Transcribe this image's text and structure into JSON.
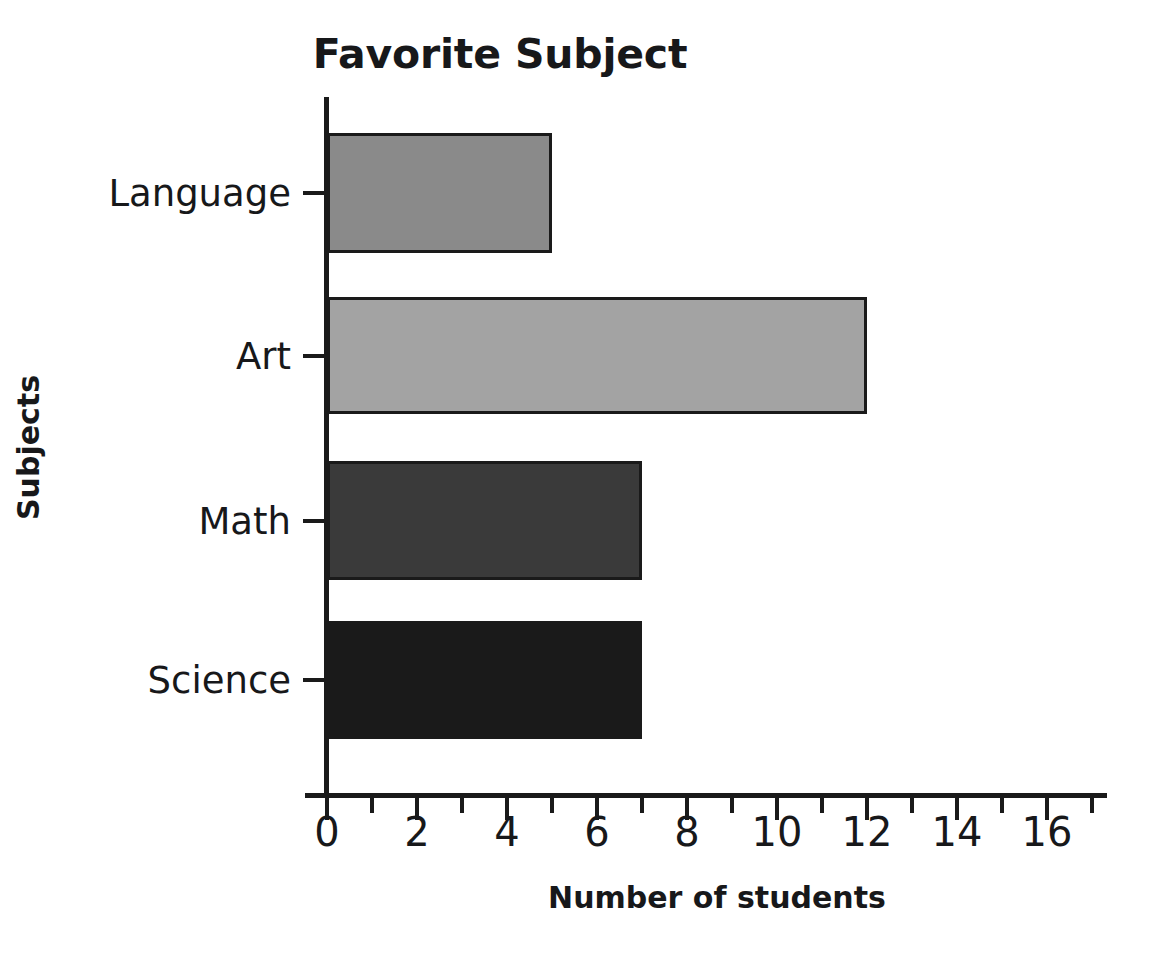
{
  "chart_data": {
    "type": "bar",
    "orientation": "horizontal",
    "title": "Favorite Subject",
    "xlabel": "Number of students",
    "ylabel": "Subjects",
    "categories": [
      "Language",
      "Art",
      "Math",
      "Science"
    ],
    "values": [
      5,
      12,
      7,
      7
    ],
    "xlim": [
      0,
      18
    ],
    "ylim": [
      0,
      4
    ],
    "grid": false,
    "legend": false,
    "x_major_ticks": [
      0,
      2,
      4,
      6,
      8,
      10,
      12,
      14,
      16
    ],
    "x_minor_ticks": [
      1,
      3,
      5,
      7,
      9,
      11,
      13,
      15,
      17
    ],
    "x_tick_labels": [
      "0",
      "2",
      "4",
      "6",
      "8",
      "10",
      "12",
      "14",
      "16"
    ],
    "bar_colors": [
      "#8a8a8a",
      "#a3a3a3",
      "#3a3a3a",
      "#1a1a1a"
    ],
    "bar_edge_color": "#1a1a1a",
    "axis_color": "#1a1a1a",
    "background_color": "#ffffff",
    "series": [
      {
        "name": "Number of students",
        "points": [
          {
            "category": "Language",
            "value": 5,
            "color": "#8a8a8a"
          },
          {
            "category": "Art",
            "value": 12,
            "color": "#a3a3a3"
          },
          {
            "category": "Math",
            "value": 7,
            "color": "#3a3a3a"
          },
          {
            "category": "Science",
            "value": 7,
            "color": "#1a1a1a"
          }
        ]
      }
    ]
  },
  "geometry": {
    "origin_x": 327,
    "px_per_unit": 45,
    "baseline_y": 793,
    "rows": [
      {
        "top": 133,
        "height": 120
      },
      {
        "top": 297,
        "height": 117
      },
      {
        "top": 461,
        "height": 119
      },
      {
        "top": 621,
        "height": 118
      }
    ]
  }
}
